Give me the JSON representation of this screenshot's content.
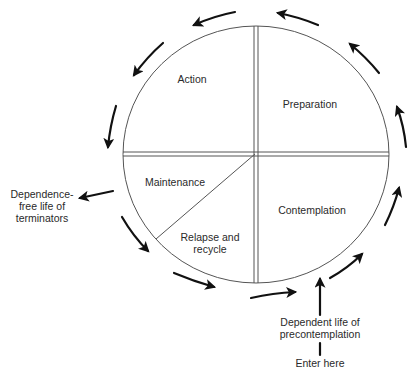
{
  "diagram": {
    "stages": [
      {
        "id": "action",
        "label": "Action"
      },
      {
        "id": "preparation",
        "label": "Preparation"
      },
      {
        "id": "maintenance",
        "label": "Maintenance"
      },
      {
        "id": "contemplation",
        "label": "Contemplation"
      },
      {
        "id": "relapse",
        "label_line1": "Relapse and",
        "label_line2": "recycle"
      }
    ],
    "exit": {
      "line1": "Dependence-",
      "line2": "free life of",
      "line3": "terminators"
    },
    "entry": {
      "line1": "Dependent life of",
      "line2": "precontemplation",
      "line3": "Enter here"
    },
    "flow_direction": "clockwise arrows around the circle (bottom left-to-right, up right side, top right-to-left, down left side)",
    "colors": {
      "line": "#555555",
      "arrow": "#111111",
      "text": "#2a2a2a",
      "background": "#ffffff"
    }
  }
}
